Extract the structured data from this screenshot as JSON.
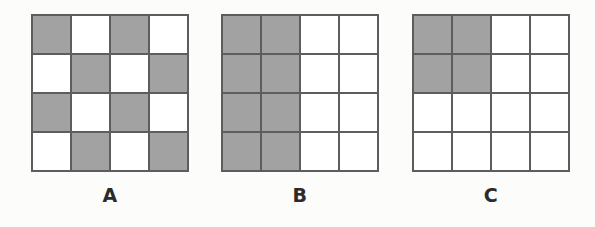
{
  "page": {
    "background_color": "#fcfcfb"
  },
  "style": {
    "shaded_color": "#a2a2a2",
    "unshaded_color": "#ffffff",
    "grid_line_color": "#5d5d5d",
    "label_color": "#2b2b2b"
  },
  "chart_data": {
    "type": "heatmap",
    "title": "",
    "xlabel": "",
    "ylabel": "",
    "legend": [],
    "grid": true,
    "rows": 4,
    "columns": 4,
    "value_meaning": {
      "1": "shaded",
      "0": "unshaded"
    },
    "figures": [
      {
        "label": "A",
        "pattern_name": "checkerboard",
        "shaded_count": 8,
        "total_cells": 16,
        "fraction_shaded": "8/16",
        "values": [
          [
            1,
            0,
            1,
            0
          ],
          [
            0,
            1,
            0,
            1
          ],
          [
            1,
            0,
            1,
            0
          ],
          [
            0,
            1,
            0,
            1
          ]
        ]
      },
      {
        "label": "B",
        "pattern_name": "left-two-columns",
        "shaded_count": 8,
        "total_cells": 16,
        "fraction_shaded": "8/16",
        "values": [
          [
            1,
            1,
            0,
            0
          ],
          [
            1,
            1,
            0,
            0
          ],
          [
            1,
            1,
            0,
            0
          ],
          [
            1,
            1,
            0,
            0
          ]
        ]
      },
      {
        "label": "C",
        "pattern_name": "top-left-two-by-two-block",
        "shaded_count": 4,
        "total_cells": 16,
        "fraction_shaded": "4/16",
        "values": [
          [
            1,
            1,
            0,
            0
          ],
          [
            1,
            1,
            0,
            0
          ],
          [
            0,
            0,
            0,
            0
          ],
          [
            0,
            0,
            0,
            0
          ]
        ]
      }
    ]
  }
}
